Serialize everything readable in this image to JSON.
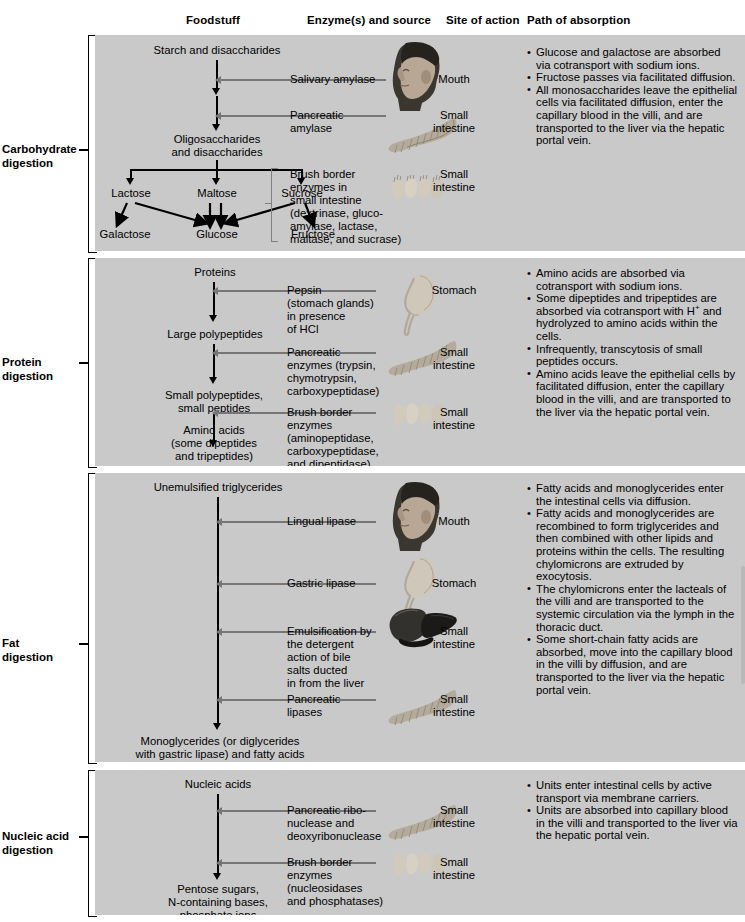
{
  "headers": [
    {
      "label": "Foodstuff",
      "x": 186
    },
    {
      "label": "Enzyme(s) and source",
      "x": 307
    },
    {
      "label": "Site of action",
      "x": 446
    },
    {
      "label": "Path of absorption",
      "x": 527
    }
  ],
  "sections": [
    {
      "id": "carbohydrate",
      "label": "Carbohydrate\ndigestion",
      "foodstuff": {
        "start": "Starch and disaccharides",
        "intermediate": "Oligosaccharides\nand disaccharides",
        "disaccharides": [
          "Lactose",
          "Maltose",
          "Sucrose"
        ],
        "monosaccharides": [
          "Galactose",
          "Glucose",
          "Fructose"
        ]
      },
      "steps": [
        {
          "enzyme": "Salivary amylase",
          "site": "Mouth",
          "organ": "head-icon"
        },
        {
          "enzyme": "Pancreatic\namylase",
          "site": "Small\nintestine",
          "organ": "pancreas-icon"
        },
        {
          "enzyme": "Brush border\nenzymes in\nsmall intestine\n(dextrinase, gluco-\namylase, lactase,\nmaltase, and sucrase)",
          "site": "Small\nintestine",
          "organ": "villi-icon"
        }
      ],
      "absorption": [
        "Glucose and galactose are absorbed via cotransport with sodium ions.",
        "Fructose passes via facilitated diffusion.",
        "All monosaccharides leave the epithelial cells via facilitated diffusion, enter the capillary blood in the villi, and are transported to the liver via the hepatic portal vein."
      ]
    },
    {
      "id": "protein",
      "label": "Protein\ndigestion",
      "foodstuff": {
        "start": "Proteins",
        "stage1": "Large polypeptides",
        "stage2": "Small polypeptides,\nsmall peptides",
        "end": "Amino acids\n(some dipeptides\nand tripeptides)"
      },
      "steps": [
        {
          "enzyme": "Pepsin\n(stomach glands)\nin presence\nof HCl",
          "site": "Stomach",
          "organ": "stomach-icon"
        },
        {
          "enzyme": "Pancreatic\nenzymes (trypsin,\nchymotrypsin,\ncarboxypeptidase)",
          "site": "Small\nintestine",
          "organ": "pancreas-icon"
        },
        {
          "enzyme": "Brush border\nenzymes\n(aminopeptidase,\ncarboxypeptidase,\nand dipeptidase)",
          "site": "Small\nintestine",
          "organ": "villi-icon"
        }
      ],
      "absorption": [
        "Amino acids are absorbed via cotransport with sodium ions.",
        "Some dipeptides and tripeptides are absorbed via cotransport with H+ and hydrolyzed to amino acids within the cells.",
        "Infrequently, transcytosis of small peptides occurs.",
        "Amino acids leave the epithelial cells by facilitated diffusion, enter the capillary blood in the villi, and are transported to the liver via the hepatic portal vein."
      ]
    },
    {
      "id": "fat",
      "label": "Fat\ndigestion",
      "foodstuff": {
        "start": "Unemulsified triglycerides",
        "end": "Monoglycerides (or diglycerides\nwith gastric lipase) and fatty acids"
      },
      "steps": [
        {
          "enzyme": "Lingual lipase",
          "site": "Mouth",
          "organ": "head-icon"
        },
        {
          "enzyme": "Gastric lipase",
          "site": "Stomach",
          "organ": "stomach-icon"
        },
        {
          "enzyme": "Emulsification by\nthe detergent\naction of bile\nsalts ducted\nin from the liver",
          "site": "Small\nintestine",
          "organ": "liver-icon"
        },
        {
          "enzyme": "Pancreatic\nlipases",
          "site": "Small\nintestine",
          "organ": "pancreas-icon"
        }
      ],
      "absorption": [
        "Fatty acids and monoglycerides enter the intestinal cells via diffusion.",
        "Fatty acids and monoglycerides are recombined to form triglycerides and then combined with other lipids and proteins within the cells. The resulting chylomicrons are extruded by exocytosis.",
        "The chylomicrons enter the lacteals of the villi and are transported to the systemic circulation via the lymph in the thoracic duct.",
        "Some short-chain fatty acids are absorbed, move into the capillary blood in the villi by diffusion, and are transported to the liver via the hepatic portal vein."
      ]
    },
    {
      "id": "nucleic",
      "label": "Nucleic acid\ndigestion",
      "foodstuff": {
        "start": "Nucleic acids",
        "end": "Pentose sugars,\nN-containing bases,\nphosphate ions"
      },
      "steps": [
        {
          "enzyme": "Pancreatic ribo-\nnuclease and\ndeoxyribonuclease",
          "site": "Small\nintestine",
          "organ": "pancreas-icon"
        },
        {
          "enzyme": "Brush border\nenzymes\n(nucleosidases\nand phosphatases)",
          "site": "Small\nintestine",
          "organ": "villi-icon"
        }
      ],
      "absorption": [
        "Units enter intestinal cells by active transport via membrane carriers.",
        "Units are absorbed into capillary blood in the villi and transported to the liver via the hepatic portal vein."
      ]
    }
  ],
  "colors": {
    "panel_background": "#c9c9c9",
    "page_background": "#ffffff",
    "flow_arrow": "#000000",
    "enzyme_arrow": "#767676",
    "text": "#000000"
  }
}
